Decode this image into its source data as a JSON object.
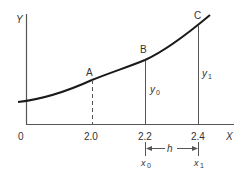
{
  "diagram": {
    "axes": {
      "y_label": "Y",
      "x_label": "X",
      "origin_label": "0"
    },
    "x_ticks": [
      "2.0",
      "2.2",
      "2.4"
    ],
    "points": [
      {
        "label": "A",
        "x": "2.0",
        "line": "dashed"
      },
      {
        "label": "B",
        "x": "2.2",
        "line": "solid",
        "ordinate": "y",
        "ordinate_sub": "0"
      },
      {
        "label": "C",
        "x": "2.4",
        "line": "solid",
        "ordinate": "y",
        "ordinate_sub": "1"
      }
    ],
    "interval": {
      "label": "h",
      "start": {
        "var": "x",
        "sub": "0"
      },
      "end": {
        "var": "x",
        "sub": "1"
      }
    },
    "colors": {
      "curve": "#1a1a1a",
      "lines": "#555555",
      "text": "#333333"
    }
  }
}
